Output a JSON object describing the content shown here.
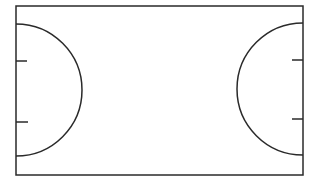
{
  "diagram": {
    "type": "court-outline",
    "stroke_color": "#2a2a2a",
    "background": "#ffffff",
    "court": {
      "x": 16,
      "y": 6,
      "width": 287,
      "height": 169
    },
    "left_area": {
      "cx": 16,
      "cy": 90,
      "r": 66,
      "ticks_y": [
        61,
        122
      ],
      "tick_length": 11
    },
    "right_area": {
      "cx": 303,
      "cy": 89,
      "r": 66,
      "ticks_y": [
        60,
        119
      ],
      "tick_length": 11
    }
  }
}
